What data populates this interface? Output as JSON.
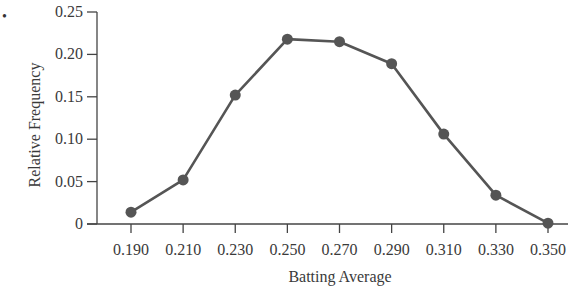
{
  "chart_data": {
    "type": "line",
    "title": "",
    "xlabel": "Batting Average",
    "ylabel": "Relative Frequency",
    "categories": [
      "0.190",
      "0.210",
      "0.230",
      "0.250",
      "0.270",
      "0.290",
      "0.310",
      "0.330",
      "0.350"
    ],
    "x": [
      0.19,
      0.21,
      0.23,
      0.25,
      0.27,
      0.29,
      0.31,
      0.33,
      0.35
    ],
    "series": [
      {
        "name": "Relative Frequency",
        "values": [
          0.014,
          0.052,
          0.152,
          0.218,
          0.215,
          0.189,
          0.106,
          0.034,
          0.001
        ],
        "color": "#555555",
        "marker": "circle"
      }
    ],
    "ylim": [
      0,
      0.25
    ],
    "yticks": [
      "0",
      "0.05",
      "0.10",
      "0.15",
      "0.20",
      "0.25"
    ],
    "ytick_values": [
      0,
      0.05,
      0.1,
      0.15,
      0.2,
      0.25
    ],
    "grid": false,
    "legend": null
  },
  "decor": {
    "bullet": "•"
  }
}
